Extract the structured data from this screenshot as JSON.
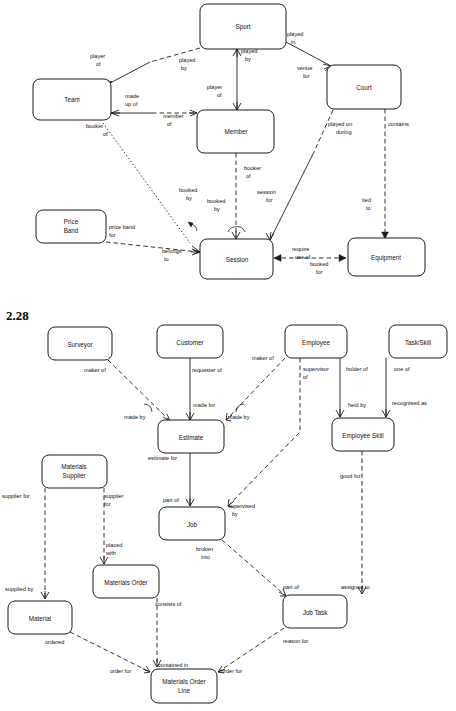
{
  "page": {
    "section_number": "2.28",
    "width": 456,
    "height": 711,
    "background": "#ffffff",
    "line_color": "#1a1a1a"
  },
  "diagram_top": {
    "name": "sports-club-er-diagram",
    "entities": [
      {
        "id": "sport",
        "label": "Sport",
        "x": 200,
        "y": 4,
        "w": 86,
        "h": 45
      },
      {
        "id": "team",
        "label": "Team",
        "x": 33,
        "y": 79,
        "w": 78,
        "h": 41
      },
      {
        "id": "court",
        "label": "Court",
        "x": 327,
        "y": 65,
        "w": 74,
        "h": 44
      },
      {
        "id": "member",
        "label": "Member",
        "x": 197,
        "y": 110,
        "w": 77,
        "h": 43
      },
      {
        "id": "priceband",
        "label": "Price Band",
        "x": 36,
        "y": 210,
        "w": 70,
        "h": 33
      },
      {
        "id": "session",
        "label": "Session",
        "x": 200,
        "y": 239,
        "w": 73,
        "h": 40
      },
      {
        "id": "equipment",
        "label": "Equipment",
        "x": 348,
        "y": 238,
        "w": 77,
        "h": 38
      }
    ],
    "relationships": [
      {
        "id": "sport-team-player-of",
        "from": "Sport",
        "to": "Team",
        "label_a": "player of",
        "label_b": "played by",
        "style": "solid-dashed"
      },
      {
        "id": "sport-member-played-by",
        "from": "Sport",
        "to": "Member",
        "label_a": "played by",
        "label_b": "player of",
        "style": "solid"
      },
      {
        "id": "sport-court-played-in",
        "from": "Sport",
        "to": "Court",
        "label_a": "played in",
        "label_b": "venue for",
        "style": "solid"
      },
      {
        "id": "team-member-made-up-of",
        "from": "Team",
        "to": "Member",
        "label_a": "made up of",
        "label_b": "member of",
        "style": "solid-dashed"
      },
      {
        "id": "team-session-booker",
        "from": "Team",
        "to": "Session",
        "label_a": "booker of",
        "label_b": "booked by",
        "style": "dotted"
      },
      {
        "id": "member-session-booker",
        "from": "Member",
        "to": "Session",
        "label_a": "booker of",
        "label_b": "booked by",
        "style": "dashed"
      },
      {
        "id": "court-session",
        "from": "Court",
        "to": "Session",
        "label_a": "played on during",
        "label_b": "session for",
        "style": "dashed-solid"
      },
      {
        "id": "court-equipment",
        "from": "Court",
        "to": "Equipment",
        "label_a": "contains",
        "label_b": "tied to",
        "style": "dashed"
      },
      {
        "id": "priceband-session",
        "from": "Price Band",
        "to": "Session",
        "label_a": "price band for",
        "label_b": "belongs to",
        "style": "dashed"
      },
      {
        "id": "session-equipment",
        "from": "Session",
        "to": "Equipment",
        "label_a": "require use of",
        "label_b": "booked for",
        "style": "dashed"
      }
    ],
    "labels": [
      {
        "text": "player",
        "x": 90,
        "y": 58
      },
      {
        "text": "of",
        "x": 96,
        "y": 66
      },
      {
        "text": "played",
        "x": 179,
        "y": 62
      },
      {
        "text": "by",
        "x": 181,
        "y": 70
      },
      {
        "text": "played",
        "x": 241,
        "y": 53
      },
      {
        "text": "by",
        "x": 245,
        "y": 61
      },
      {
        "text": "played",
        "x": 287,
        "y": 36
      },
      {
        "text": "in",
        "x": 291,
        "y": 44
      },
      {
        "text": "venue",
        "x": 297,
        "y": 70
      },
      {
        "text": "for",
        "x": 303,
        "y": 78
      },
      {
        "text": "player",
        "x": 207,
        "y": 89
      },
      {
        "text": "of",
        "x": 217,
        "y": 97
      },
      {
        "text": "made",
        "x": 125,
        "y": 98
      },
      {
        "text": "up of",
        "x": 125,
        "y": 106
      },
      {
        "text": "member",
        "x": 163,
        "y": 118
      },
      {
        "text": "of",
        "x": 167,
        "y": 126
      },
      {
        "text": "booker",
        "x": 86,
        "y": 128
      },
      {
        "text": "of",
        "x": 103,
        "y": 136
      },
      {
        "text": "played on",
        "x": 328,
        "y": 126
      },
      {
        "text": "during",
        "x": 336,
        "y": 134
      },
      {
        "text": "contains",
        "x": 388,
        "y": 126
      },
      {
        "text": "booker",
        "x": 244,
        "y": 170
      },
      {
        "text": "of",
        "x": 246,
        "y": 178
      },
      {
        "text": "booked",
        "x": 179,
        "y": 192
      },
      {
        "text": "by",
        "x": 186,
        "y": 200
      },
      {
        "text": "booked",
        "x": 207,
        "y": 203
      },
      {
        "text": "by",
        "x": 214,
        "y": 211
      },
      {
        "text": "session",
        "x": 257,
        "y": 194
      },
      {
        "text": "for",
        "x": 266,
        "y": 202
      },
      {
        "text": "tied",
        "x": 362,
        "y": 202
      },
      {
        "text": "to",
        "x": 366,
        "y": 210
      },
      {
        "text": "price band",
        "x": 109,
        "y": 229
      },
      {
        "text": "for",
        "x": 109,
        "y": 237
      },
      {
        "text": "belongs",
        "x": 162,
        "y": 253
      },
      {
        "text": "to",
        "x": 164,
        "y": 261
      },
      {
        "text": "require",
        "x": 292,
        "y": 251
      },
      {
        "text": "use of",
        "x": 295,
        "y": 259
      },
      {
        "text": "booked",
        "x": 310,
        "y": 266
      },
      {
        "text": "for",
        "x": 316,
        "y": 274
      }
    ]
  },
  "diagram_bottom": {
    "name": "job-materials-er-diagram",
    "entities": [
      {
        "id": "surveyor",
        "label": "Surveyor",
        "x": 48,
        "y": 327,
        "w": 64,
        "h": 33
      },
      {
        "id": "customer",
        "label": "Customer",
        "x": 157,
        "y": 325,
        "w": 66,
        "h": 33
      },
      {
        "id": "employee",
        "label": "Employee",
        "x": 285,
        "y": 325,
        "w": 62,
        "h": 33
      },
      {
        "id": "taskskill",
        "label": "Task/Skill",
        "x": 389,
        "y": 325,
        "w": 58,
        "h": 33
      },
      {
        "id": "estimate",
        "label": "Estimate",
        "x": 158,
        "y": 420,
        "w": 66,
        "h": 33
      },
      {
        "id": "employeeskill",
        "label": "Employee Skill",
        "x": 332,
        "y": 418,
        "w": 62,
        "h": 33
      },
      {
        "id": "matsupplier",
        "label": "Materials Supplier",
        "x": 42,
        "y": 455,
        "w": 65,
        "h": 33
      },
      {
        "id": "job",
        "label": "Job",
        "x": 159,
        "y": 507,
        "w": 66,
        "h": 33
      },
      {
        "id": "matorder",
        "label": "Materials Order",
        "x": 93,
        "y": 565,
        "w": 66,
        "h": 33
      },
      {
        "id": "material",
        "label": "Material",
        "x": 8,
        "y": 601,
        "w": 64,
        "h": 33
      },
      {
        "id": "jobtask",
        "label": "Job Task",
        "x": 283,
        "y": 595,
        "w": 64,
        "h": 33
      },
      {
        "id": "matorderline",
        "label": "Materials Order Line",
        "x": 151,
        "y": 669,
        "w": 66,
        "h": 34
      }
    ],
    "relationships": [
      {
        "id": "surveyor-estimate",
        "from": "Surveyor",
        "to": "Estimate",
        "label_a": "maker of",
        "label_b": "made by",
        "style": "dashed"
      },
      {
        "id": "customer-estimate",
        "from": "Customer",
        "to": "Estimate",
        "label_a": "requester of",
        "label_b": "made for",
        "style": "solid"
      },
      {
        "id": "employee-estimate",
        "from": "Employee",
        "to": "Estimate",
        "label_a": "maker of",
        "label_b": "made by",
        "style": "dashed"
      },
      {
        "id": "employee-supervisor",
        "from": "Employee",
        "to": "Job",
        "label_a": "supervisor of",
        "label_b": "supervised by",
        "style": "dashed"
      },
      {
        "id": "employee-skill",
        "from": "Employee",
        "to": "Employee Skill",
        "label_a": "holder of",
        "label_b": "held by",
        "style": "solid"
      },
      {
        "id": "taskskill-skill",
        "from": "Task/Skill",
        "to": "Employee Skill",
        "label_a": "one of",
        "label_b": "recognised as",
        "style": "solid"
      },
      {
        "id": "estimate-job",
        "from": "Estimate",
        "to": "Job",
        "label_a": "estimate for",
        "label_b": "part of",
        "style": "solid"
      },
      {
        "id": "skill-jobtask",
        "from": "Employee Skill",
        "to": "Job Task",
        "label_a": "good for",
        "label_b": "assigned to",
        "style": "dashed"
      },
      {
        "id": "supplier-material",
        "from": "Materials Supplier",
        "to": "Material",
        "label_a": "supplier for",
        "label_b": "supplied by",
        "style": "dashed"
      },
      {
        "id": "supplier-matorder",
        "from": "Materials Supplier",
        "to": "Materials Order",
        "label_a": "supplier for",
        "label_b": "placed with",
        "style": "dashed"
      },
      {
        "id": "job-jobtask",
        "from": "Job",
        "to": "Job Task",
        "label_a": "broken into",
        "label_b": "part of",
        "style": "dashed"
      },
      {
        "id": "matorder-line",
        "from": "Materials Order",
        "to": "Materials Order Line",
        "label_a": "consists of",
        "label_b": "contained in",
        "style": "dashed"
      },
      {
        "id": "material-line",
        "from": "Material",
        "to": "Materials Order Line",
        "label_a": "ordered",
        "label_b": "order for",
        "style": "dashed"
      },
      {
        "id": "jobtask-line",
        "from": "Job Task",
        "to": "Materials Order Line",
        "label_a": "reason for",
        "label_b": "order for",
        "style": "dashed"
      }
    ],
    "labels": [
      {
        "text": "maker of",
        "x": 84,
        "y": 372
      },
      {
        "text": "requester of",
        "x": 192,
        "y": 372
      },
      {
        "text": "maker of",
        "x": 252,
        "y": 360
      },
      {
        "text": "supervisor",
        "x": 303,
        "y": 371
      },
      {
        "text": "of",
        "x": 303,
        "y": 379
      },
      {
        "text": "holder of",
        "x": 346,
        "y": 371
      },
      {
        "text": "one of",
        "x": 394,
        "y": 371
      },
      {
        "text": "made by",
        "x": 124,
        "y": 419
      },
      {
        "text": "made for",
        "x": 193,
        "y": 407
      },
      {
        "text": "made by",
        "x": 228,
        "y": 419
      },
      {
        "text": "held by",
        "x": 348,
        "y": 407
      },
      {
        "text": "recognised as",
        "x": 392,
        "y": 405
      },
      {
        "text": "estimate for",
        "x": 148,
        "y": 460
      },
      {
        "text": "good for",
        "x": 340,
        "y": 478
      },
      {
        "text": "supplier for",
        "x": 2,
        "y": 498
      },
      {
        "text": "supplier",
        "x": 104,
        "y": 498
      },
      {
        "text": "for",
        "x": 104,
        "y": 506
      },
      {
        "text": "part of",
        "x": 163,
        "y": 502
      },
      {
        "text": "supervised",
        "x": 228,
        "y": 508
      },
      {
        "text": "by",
        "x": 232,
        "y": 516
      },
      {
        "text": "placed",
        "x": 106,
        "y": 547
      },
      {
        "text": "with",
        "x": 106,
        "y": 555
      },
      {
        "text": "broken",
        "x": 196,
        "y": 551
      },
      {
        "text": "into",
        "x": 201,
        "y": 559
      },
      {
        "text": "supplied by",
        "x": 5,
        "y": 591
      },
      {
        "text": "part of",
        "x": 283,
        "y": 589
      },
      {
        "text": "assigned to",
        "x": 341,
        "y": 589
      },
      {
        "text": "consists of",
        "x": 155,
        "y": 606
      },
      {
        "text": "ordered",
        "x": 45,
        "y": 644
      },
      {
        "text": "reason for",
        "x": 283,
        "y": 643
      },
      {
        "text": "order for",
        "x": 110,
        "y": 673
      },
      {
        "text": "contained in",
        "x": 158,
        "y": 667
      },
      {
        "text": "order for",
        "x": 221,
        "y": 673
      }
    ]
  }
}
